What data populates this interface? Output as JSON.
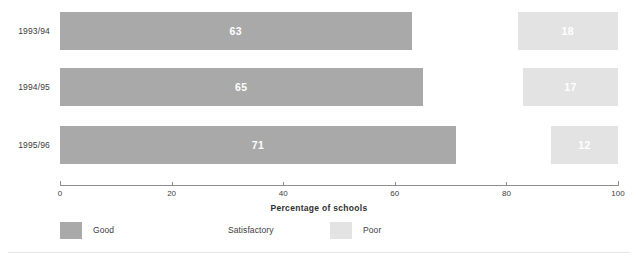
{
  "chart_data": {
    "type": "bar",
    "orientation": "horizontal",
    "stacked": true,
    "title": "",
    "xlabel": "Percentage of schools",
    "ylabel": "",
    "xlim": [
      0,
      100
    ],
    "grid": false,
    "legend_position": "bottom-left",
    "categories": [
      "1993/94",
      "1994/95",
      "1995/96"
    ],
    "tick_labels": [
      "0",
      "20",
      "40",
      "60",
      "80",
      "100"
    ],
    "tick_values": [
      0,
      20,
      40,
      60,
      80,
      100
    ],
    "series": [
      {
        "name": "Good",
        "color": "#a9a9a9",
        "values": [
          63,
          65,
          71
        ],
        "label_color": "#ffffff"
      },
      {
        "name": "Satisfactory",
        "color": "#ffffff",
        "values": [
          19,
          18,
          17
        ],
        "label_color": "#ffffff"
      },
      {
        "name": "Poor",
        "color": "#e3e3e3",
        "values": [
          18,
          17,
          12
        ],
        "label_color": "#ffffff"
      }
    ],
    "value_labels_shown": [
      {
        "series": "Good",
        "labels": [
          "63",
          "65",
          "71"
        ]
      },
      {
        "series": "Satisfactory",
        "labels": [
          "",
          "",
          ""
        ]
      },
      {
        "series": "Poor",
        "labels": [
          "18",
          "17",
          "12"
        ]
      }
    ]
  },
  "rows": [
    {
      "label": "1993/94",
      "segments": [
        {
          "series": "Good",
          "value": 63,
          "value_label": "63",
          "start": 0,
          "width": 63
        },
        {
          "series": "Satisfactory",
          "value": 19,
          "value_label": "",
          "start": 63,
          "width": 19
        },
        {
          "series": "Poor",
          "value": 18,
          "value_label": "18",
          "start": 82,
          "width": 18
        }
      ]
    },
    {
      "label": "1994/95",
      "segments": [
        {
          "series": "Good",
          "value": 65,
          "value_label": "65",
          "start": 0,
          "width": 65
        },
        {
          "series": "Satisfactory",
          "value": 18,
          "value_label": "",
          "start": 65,
          "width": 18
        },
        {
          "series": "Poor",
          "value": 17,
          "value_label": "17",
          "start": 83,
          "width": 17
        }
      ]
    },
    {
      "label": "1995/96",
      "segments": [
        {
          "series": "Good",
          "value": 71,
          "value_label": "71",
          "start": 0,
          "width": 71
        },
        {
          "series": "Satisfactory",
          "value": 17,
          "value_label": "",
          "start": 71,
          "width": 17
        },
        {
          "series": "Poor",
          "value": 12,
          "value_label": "12",
          "start": 88,
          "width": 12
        }
      ]
    }
  ],
  "axis": {
    "title": "Percentage of schools",
    "ticks": [
      {
        "value": 0,
        "label": "0"
      },
      {
        "value": 20,
        "label": "20"
      },
      {
        "value": 40,
        "label": "40"
      },
      {
        "value": 60,
        "label": "60"
      },
      {
        "value": 80,
        "label": "80"
      },
      {
        "value": 100,
        "label": "100"
      }
    ]
  },
  "legend": {
    "items": [
      {
        "label": "Good",
        "color": "#a9a9a9",
        "swatch_class": "sw-good",
        "left": 0
      },
      {
        "label": "Satisfactory",
        "color": "#ffffff",
        "swatch_class": "sw-sat",
        "left": 135
      },
      {
        "label": "Poor",
        "color": "#e3e3e3",
        "swatch_class": "sw-poor",
        "left": 270
      }
    ]
  },
  "colors": {
    "good": "#a9a9a9",
    "satisfactory": "#ffffff",
    "poor": "#e3e3e3",
    "axis": "#8d8d8d",
    "text": "#3c3c3c",
    "background": "#ffffff"
  },
  "layout": {
    "plot_left": 60,
    "plot_width": 558,
    "row_tops": [
      12,
      68,
      126
    ],
    "row_height": 38,
    "axis_top": 185
  }
}
